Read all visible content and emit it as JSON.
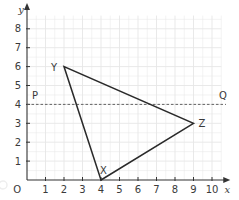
{
  "diagram": {
    "type": "coordinate-grid",
    "axes": {
      "x_label": "x",
      "y_label": "y",
      "origin_label": "O",
      "x_ticks": [
        "1",
        "2",
        "3",
        "4",
        "5",
        "6",
        "7",
        "8",
        "9",
        "10"
      ],
      "y_ticks": [
        "1",
        "2",
        "3",
        "4",
        "5",
        "6",
        "7",
        "8"
      ],
      "x_range": [
        0,
        10.5
      ],
      "y_range": [
        0,
        8.7
      ]
    },
    "triangle": {
      "vertices": [
        {
          "label": "X",
          "x": 4,
          "y": 0
        },
        {
          "label": "Y",
          "x": 2,
          "y": 6
        },
        {
          "label": "Z",
          "x": 9,
          "y": 3
        }
      ]
    },
    "line_PQ": {
      "style": "dashed",
      "y": 4,
      "start_label": "P",
      "end_label": "Q"
    },
    "colors": {
      "grid": "#e6e6e6",
      "axis": "#333333",
      "triangle": "#2a2a2a",
      "dashed_line": "#555555",
      "text": "#3a3a3a"
    }
  }
}
